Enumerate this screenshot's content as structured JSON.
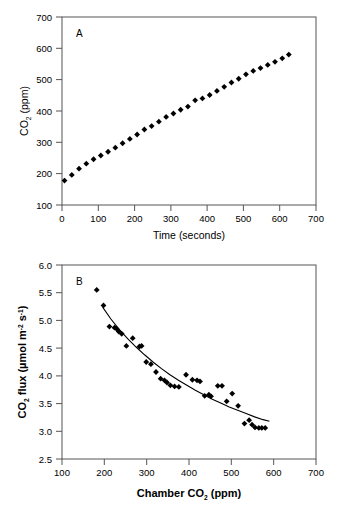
{
  "figure": {
    "background": "#ffffff",
    "marker_color": "#000000",
    "axis_color": "#555555",
    "curve_color": "#000000"
  },
  "panels": [
    {
      "letter": "A",
      "xlabel": "Time (seconds)",
      "ylabel_main": "CO",
      "ylabel_sub": "2",
      "ylabel_tail": " (ppm)",
      "xticks": [
        "0",
        "100",
        "200",
        "300",
        "400",
        "500",
        "600",
        "700"
      ],
      "yticks": [
        "100",
        "200",
        "300",
        "400",
        "500",
        "600",
        "700"
      ]
    },
    {
      "letter": "B",
      "xlabel_main": "Chamber CO",
      "xlabel_sub": "2",
      "xlabel_tail": " (ppm)",
      "ylabel_main": "CO",
      "ylabel_sub": "2",
      "ylabel_mid": " flux (µmol m",
      "ylabel_sup1": "-2",
      "ylabel_mid2": " s",
      "ylabel_sup2": "-1",
      "ylabel_tail": ")",
      "xticks": [
        "100",
        "200",
        "300",
        "400",
        "500",
        "600",
        "700"
      ],
      "yticks": [
        "2.5",
        "3.0",
        "3.5",
        "4.0",
        "4.5",
        "5.0",
        "5.5",
        "6.0"
      ]
    }
  ],
  "chart_data": [
    {
      "type": "scatter",
      "panel": "A",
      "title": "",
      "xlabel": "Time (seconds)",
      "ylabel": "CO2 (ppm)",
      "xlim": [
        0,
        700
      ],
      "ylim": [
        100,
        700
      ],
      "xticks": [
        0,
        100,
        200,
        300,
        400,
        500,
        600,
        700
      ],
      "yticks": [
        100,
        200,
        300,
        400,
        500,
        600,
        700
      ],
      "grid": false,
      "legend": "none",
      "marker": "filled-diamond",
      "x": [
        7,
        27,
        47,
        67,
        87,
        107,
        127,
        147,
        167,
        187,
        207,
        227,
        247,
        267,
        287,
        307,
        327,
        347,
        367,
        387,
        407,
        427,
        447,
        467,
        487,
        507,
        527,
        547,
        567,
        587,
        607,
        625
      ],
      "y": [
        178,
        196,
        216,
        232,
        246,
        258,
        270,
        283,
        297,
        311,
        325,
        341,
        352,
        366,
        381,
        392,
        404,
        414,
        434,
        440,
        451,
        464,
        477,
        491,
        503,
        517,
        528,
        537,
        547,
        557,
        568,
        580
      ]
    },
    {
      "type": "scatter",
      "panel": "B",
      "title": "",
      "xlabel": "Chamber CO2 (ppm)",
      "ylabel": "CO2 flux (umol m-2 s-1)",
      "xlim": [
        100,
        700
      ],
      "ylim": [
        2.5,
        6.0
      ],
      "xticks": [
        100,
        200,
        300,
        400,
        500,
        600,
        700
      ],
      "yticks": [
        2.5,
        3.0,
        3.5,
        4.0,
        4.5,
        5.0,
        5.5,
        6.0
      ],
      "grid": false,
      "legend": "none",
      "marker": "filled-diamond",
      "x": [
        182,
        198,
        212,
        224,
        229,
        234,
        241,
        252,
        267,
        283,
        288,
        299,
        310,
        322,
        333,
        342,
        348,
        356,
        366,
        376,
        393,
        408,
        419,
        426,
        437,
        447,
        452,
        468,
        478,
        489,
        502,
        516,
        531,
        542,
        549,
        556,
        565,
        572,
        580
      ],
      "y": [
        5.55,
        5.27,
        4.89,
        4.87,
        4.85,
        4.8,
        4.76,
        4.54,
        4.68,
        4.53,
        4.54,
        4.25,
        4.21,
        4.07,
        3.95,
        3.92,
        3.88,
        3.83,
        3.81,
        3.8,
        4.02,
        3.93,
        3.92,
        3.9,
        3.64,
        3.66,
        3.63,
        3.82,
        3.82,
        3.54,
        3.68,
        3.46,
        3.14,
        3.2,
        3.12,
        3.07,
        3.06,
        3.06,
        3.06
      ],
      "fit_curve": {
        "description": "decreasing exponential-like fit",
        "x": [
          196,
          215,
          235,
          255,
          275,
          295,
          315,
          335,
          355,
          375,
          395,
          415,
          435,
          455,
          475,
          495,
          515,
          535,
          555,
          575,
          590
        ],
        "y": [
          5.24,
          5.03,
          4.84,
          4.67,
          4.52,
          4.38,
          4.25,
          4.13,
          4.02,
          3.92,
          3.83,
          3.74,
          3.66,
          3.58,
          3.51,
          3.44,
          3.38,
          3.32,
          3.26,
          3.21,
          3.18
        ]
      }
    }
  ]
}
